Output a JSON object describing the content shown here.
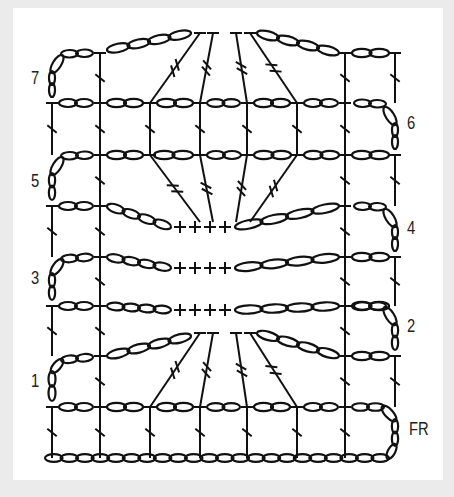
{
  "diagram": {
    "type": "crochet-stitch-chart",
    "row_labels": {
      "foundation": "FR",
      "r1": "1",
      "r2": "2",
      "r3": "3",
      "r4": "4",
      "r5": "5",
      "r6": "6",
      "r7": "7"
    },
    "symbols": {
      "chain": "oval",
      "double_crochet": "T with slash",
      "treble": "T with double slash",
      "single_crochet": "+"
    },
    "colors": {
      "background": "#ebebeb",
      "panel": "#ffffff",
      "ink": "#111111"
    }
  }
}
